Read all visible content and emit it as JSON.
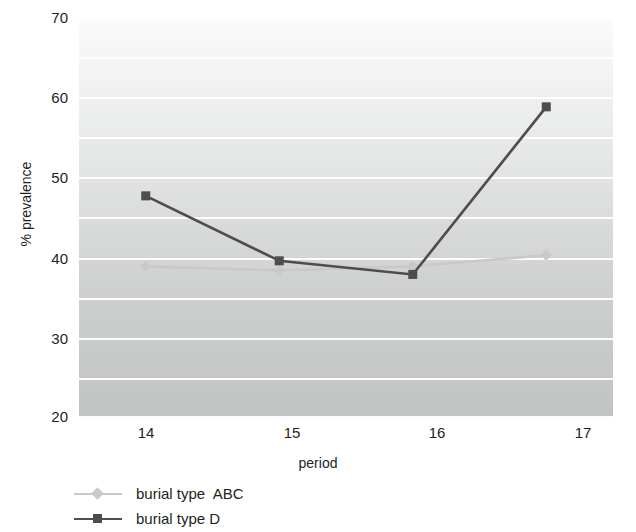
{
  "chart_data": {
    "type": "line",
    "title": "",
    "xlabel": "period",
    "ylabel": "% prevalence",
    "x": [
      14,
      15,
      16,
      17
    ],
    "xticklabels": [
      "14",
      "15",
      "16",
      "17"
    ],
    "yticklabels": [
      "20",
      "30",
      "40",
      "50",
      "60",
      "70"
    ],
    "yticks": [
      20,
      30,
      40,
      50,
      60,
      70
    ],
    "ylim": [
      20,
      70
    ],
    "xlim": [
      13.5,
      17.5
    ],
    "grid": "horizontal-major-and-minor-white-lines-every-5-units",
    "gridlines": [
      20,
      25,
      30,
      35,
      40,
      45,
      50,
      55,
      60,
      65,
      70
    ],
    "legend_position": "below-plot-left",
    "background": "vertical-gray-gradient",
    "series": [
      {
        "name": "burial type  ABC",
        "marker": "diamond",
        "color": "#c9c9c9",
        "values": [
          38.9,
          38.4,
          38.9,
          40.3
        ]
      },
      {
        "name": "burial type D",
        "marker": "square",
        "color": "#4d4d4d",
        "values": [
          47.7,
          39.6,
          37.9,
          58.8
        ]
      }
    ]
  },
  "axis": {
    "y_title": "% prevalence",
    "x_title": "period"
  },
  "legend": {
    "items": [
      {
        "label": "burial type  ABC",
        "color": "#c9c9c9",
        "marker": "diamond-icon"
      },
      {
        "label": "burial type D",
        "color": "#4d4d4d",
        "marker": "square-icon"
      }
    ]
  },
  "colors": {
    "series_abc": "#c9c9c9",
    "series_d": "#4d4d4d",
    "gridline": "#ffffff",
    "text": "#231f20"
  }
}
